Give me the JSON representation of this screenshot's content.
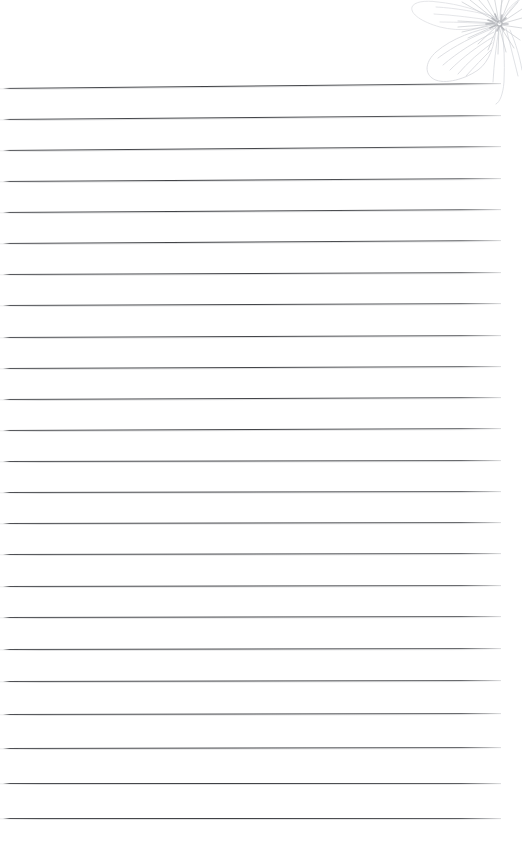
{
  "page": {
    "kind": "lined-notebook-page",
    "background_color": "#ffffff",
    "width_px": 522,
    "height_px": 867
  },
  "paper": {
    "rule_color": "#3a3c40",
    "rule_count": 24,
    "first_rule_y": 88,
    "rule_spacing_px": 31,
    "rule_left_x": 0,
    "rule_right_x": 501,
    "text_content": "",
    "rule_lines": [
      {
        "index": 1,
        "y": 88,
        "right_y": 83,
        "width": 501
      },
      {
        "index": 2,
        "y": 119,
        "right_y": 115,
        "width": 501
      },
      {
        "index": 3,
        "y": 150,
        "right_y": 146,
        "width": 501
      },
      {
        "index": 4,
        "y": 181,
        "right_y": 178,
        "width": 501
      },
      {
        "index": 5,
        "y": 212,
        "right_y": 209,
        "width": 501
      },
      {
        "index": 6,
        "y": 243,
        "right_y": 240,
        "width": 501
      },
      {
        "index": 7,
        "y": 274,
        "right_y": 272,
        "width": 501
      },
      {
        "index": 8,
        "y": 305,
        "right_y": 303,
        "width": 501
      },
      {
        "index": 9,
        "y": 337,
        "right_y": 335,
        "width": 501
      },
      {
        "index": 10,
        "y": 368,
        "right_y": 366,
        "width": 501
      },
      {
        "index": 11,
        "y": 399,
        "right_y": 397,
        "width": 501
      },
      {
        "index": 12,
        "y": 430,
        "right_y": 428,
        "width": 501
      },
      {
        "index": 13,
        "y": 461,
        "right_y": 460,
        "width": 501
      },
      {
        "index": 14,
        "y": 492,
        "right_y": 491,
        "width": 501
      },
      {
        "index": 15,
        "y": 523,
        "right_y": 522,
        "width": 501
      },
      {
        "index": 16,
        "y": 554,
        "right_y": 553,
        "width": 501
      },
      {
        "index": 17,
        "y": 586,
        "right_y": 585,
        "width": 501
      },
      {
        "index": 18,
        "y": 617,
        "right_y": 616,
        "width": 501
      },
      {
        "index": 19,
        "y": 649,
        "right_y": 648,
        "width": 501
      },
      {
        "index": 20,
        "y": 681,
        "right_y": 680,
        "width": 501
      },
      {
        "index": 21,
        "y": 714,
        "right_y": 713,
        "width": 501
      },
      {
        "index": 22,
        "y": 748,
        "right_y": 747,
        "width": 501
      },
      {
        "index": 23,
        "y": 783,
        "right_y": 783,
        "width": 501
      },
      {
        "index": 24,
        "y": 818,
        "right_y": 818,
        "width": 501
      }
    ]
  },
  "decoration": {
    "name": "flower-sketch",
    "description": "faint pale-gray pencil line drawing of a blossom with radiating stamens and broad petals",
    "stroke_color": "#d2d4d8",
    "accent_color": "#b9bbc0",
    "position": "top-right",
    "width_px": 122,
    "height_px": 112
  }
}
